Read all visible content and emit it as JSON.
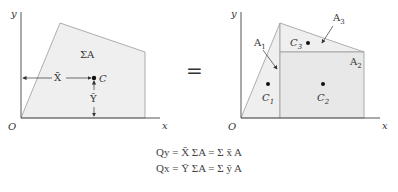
{
  "left_panel": {
    "y_axis_label": "y",
    "x_axis_label": "x",
    "origin_label": "O",
    "area_label": "ΣA",
    "centroid_label": "C",
    "xbar_label": "X̄",
    "ybar_label": "Ȳ"
  },
  "equals_sign": "=",
  "right_panel": {
    "y_axis_label": "y",
    "x_axis_label": "x",
    "origin_label": "O",
    "areas": [
      {
        "label": "A",
        "sub": "1"
      },
      {
        "label": "A",
        "sub": "2"
      },
      {
        "label": "A",
        "sub": "3"
      }
    ],
    "centroids": [
      {
        "label": "C",
        "sub": "1"
      },
      {
        "label": "C",
        "sub": "2"
      },
      {
        "label": "C",
        "sub": "3"
      }
    ]
  },
  "equations": [
    "Qy = X̄ ΣA = Σ x̄ A",
    "Qx = Ȳ ΣA = Σ ȳ A"
  ],
  "colors": {
    "fill": "#efefef",
    "outline": "#9a9a9a",
    "axis": "#555555"
  }
}
